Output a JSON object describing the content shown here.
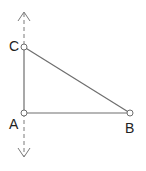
{
  "diagram": {
    "type": "right-triangle-with-vertical-line",
    "colors": {
      "stroke": "#6e6e6e",
      "dashed": "#7a7a7a",
      "point_fill": "#ffffff",
      "label": "#222222"
    },
    "points": [
      {
        "id": "A",
        "label": "A",
        "x": 24,
        "y": 113
      },
      {
        "id": "B",
        "label": "B",
        "x": 130,
        "y": 113
      },
      {
        "id": "C",
        "label": "C",
        "x": 24,
        "y": 47
      }
    ],
    "segments": [
      {
        "from": "A",
        "to": "B"
      },
      {
        "from": "A",
        "to": "C"
      },
      {
        "from": "C",
        "to": "B"
      }
    ],
    "line": {
      "style": "dashed",
      "through": [
        "C",
        "A"
      ],
      "arrows": "both",
      "x": 24,
      "y_top": 12,
      "y_bottom": 157
    }
  }
}
